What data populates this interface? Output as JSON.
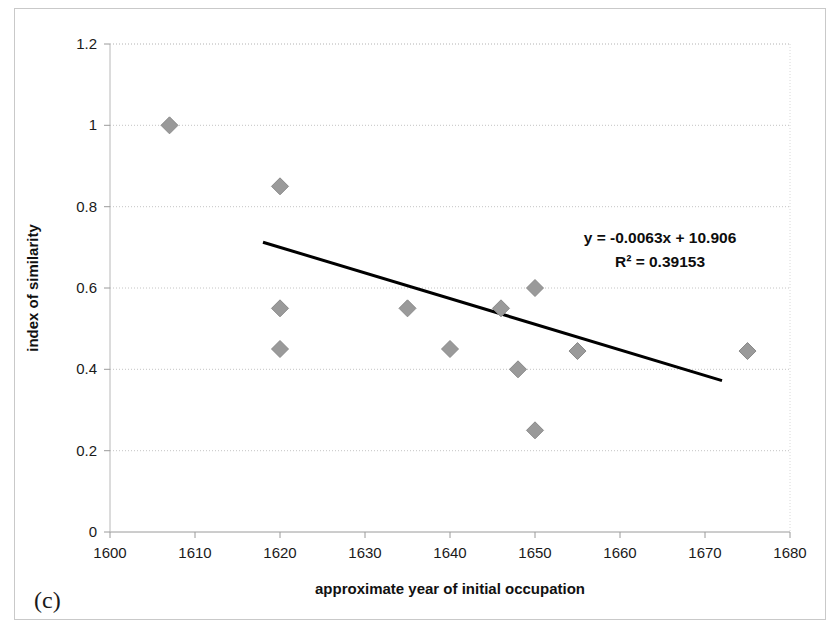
{
  "figure": {
    "panel_label": "(c)",
    "background_color": "#ffffff",
    "frame_color": "#c9c9c9"
  },
  "annotations": {
    "equation": "y = -0.0063x + 10.906",
    "r_squared": "R² = 0.39153"
  },
  "chart_data": {
    "type": "scatter",
    "title": "",
    "xlabel": "approximate year of initial occupation",
    "ylabel": "index of similarity",
    "xlim": [
      1600,
      1680
    ],
    "ylim": [
      0,
      1.2
    ],
    "xticks": [
      1600,
      1610,
      1620,
      1630,
      1640,
      1650,
      1660,
      1670,
      1680
    ],
    "xtick_labels": [
      "1600",
      "1610",
      "1620",
      "1630",
      "1640",
      "1650",
      "1660",
      "1670",
      "1680"
    ],
    "yticks": [
      0,
      0.2,
      0.4,
      0.6,
      0.8,
      1,
      1.2
    ],
    "ytick_labels": [
      "0",
      "0.2",
      "0.4",
      "0.6",
      "0.8",
      "1",
      "1.2"
    ],
    "grid": "horizontal-dotted",
    "legend": "none",
    "marker": "diamond",
    "marker_color": "#9a9a9a",
    "marker_edge_color": "#8a8a8a",
    "points": [
      {
        "x": 1607,
        "y": 1.0
      },
      {
        "x": 1620,
        "y": 0.85
      },
      {
        "x": 1620,
        "y": 0.55
      },
      {
        "x": 1620,
        "y": 0.45
      },
      {
        "x": 1635,
        "y": 0.55
      },
      {
        "x": 1640,
        "y": 0.45
      },
      {
        "x": 1646,
        "y": 0.55
      },
      {
        "x": 1648,
        "y": 0.4
      },
      {
        "x": 1650,
        "y": 0.6
      },
      {
        "x": 1650,
        "y": 0.25
      },
      {
        "x": 1655,
        "y": 0.445
      },
      {
        "x": 1675,
        "y": 0.445
      }
    ],
    "trendline": {
      "slope": -0.0063,
      "intercept": 10.906,
      "r_squared": 0.39153,
      "x_start": 1618,
      "x_end": 1672,
      "color": "#000000",
      "width": 3
    }
  }
}
